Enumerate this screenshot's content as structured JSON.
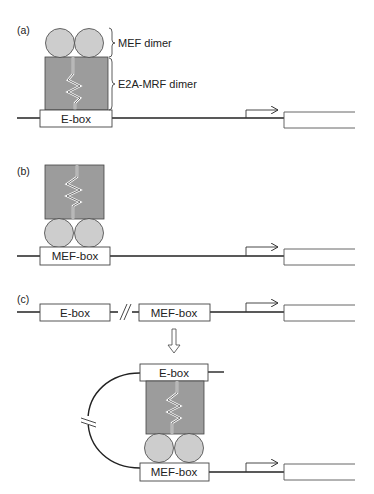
{
  "figure": {
    "panels": [
      {
        "id": "a",
        "label": "(a)",
        "elements": [
          "MEF dimer",
          "E2A-MRF dimer",
          "E-box"
        ]
      },
      {
        "id": "b",
        "label": "(b)",
        "elements": [
          "E2A-MRF dimer",
          "MEF dimer",
          "MEF-box"
        ]
      },
      {
        "id": "c",
        "label": "(c)",
        "elements": [
          "E-box",
          "MEF-box",
          "E2A-MRF dimer",
          "MEF dimer"
        ]
      }
    ],
    "annotations": {
      "mef_dimer": "MEF dimer",
      "e2a_mrf_dimer": "E2A-MRF dimer"
    },
    "boxes": {
      "e_box": "E-box",
      "mef_box": "MEF-box"
    },
    "colors": {
      "dimer_fill": "#9c9c9c",
      "circle_fill": "#cdcdcd",
      "outline": "#333333",
      "dna_line": "#222222"
    }
  }
}
